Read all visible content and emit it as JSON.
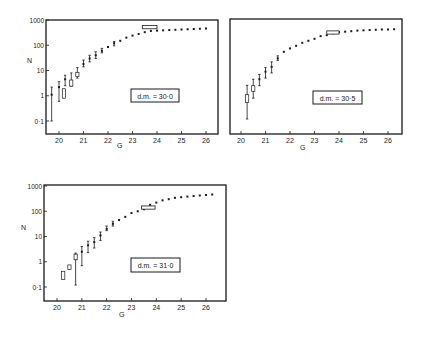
{
  "figure": {
    "panels_count": 3,
    "colors": {
      "ink": "#1a1a1a",
      "background": "#ffffff"
    }
  },
  "chart_data": [
    {
      "type": "scatter",
      "title": "",
      "label": "d.m. = 30·0",
      "xlabel": "G",
      "ylabel": "N",
      "yscale": "log",
      "xlim": [
        19.5,
        26.5
      ],
      "ylim": [
        0.03,
        1000
      ],
      "xticks": [
        "20",
        "21",
        "22",
        "23",
        "24",
        "25",
        "26"
      ],
      "yticks": [
        "0·1",
        "1",
        "10",
        "100",
        "1000"
      ],
      "grid": false,
      "frame": {
        "x0": 46,
        "y0": 20,
        "x1": 218,
        "y1": 134,
        "gx0": 59,
        "gx1": 206,
        "ytop": 20,
        "ybot": 121
      },
      "points": [
        {
          "g": 19.7,
          "n": 1.1,
          "lo": 0.1,
          "hi": 2.2
        },
        {
          "g": 20.0,
          "n": 2.2,
          "lo": 0.6,
          "hi": 3.6
        },
        {
          "g": 20.2,
          "n": 1.3,
          "box": [
            0.8,
            1.9
          ]
        },
        {
          "g": 20.25,
          "n": 4.5,
          "lo": 2.5,
          "hi": 6.5
        },
        {
          "g": 20.5,
          "n": 3.2,
          "box": [
            2.4,
            4.2
          ],
          "lo": 2.4,
          "hi": 8
        },
        {
          "g": 20.75,
          "n": 7,
          "box": [
            5.8,
            8.5
          ],
          "lo": 5,
          "hi": 13
        },
        {
          "g": 21.0,
          "n": 18,
          "lo": 14,
          "hi": 26
        },
        {
          "g": 21.25,
          "n": 30,
          "lo": 22,
          "hi": 40
        },
        {
          "g": 21.5,
          "n": 40,
          "lo": 30,
          "hi": 55
        },
        {
          "g": 21.75,
          "n": 60,
          "lo": 50,
          "hi": 75
        },
        {
          "g": 22.0,
          "n": 85
        },
        {
          "g": 22.25,
          "n": 120,
          "lo": 95,
          "hi": 140
        },
        {
          "g": 22.5,
          "n": 150
        },
        {
          "g": 22.75,
          "n": 200
        },
        {
          "g": 23.0,
          "n": 240
        },
        {
          "g": 23.25,
          "n": 280
        },
        {
          "g": 23.5,
          "n": 330
        },
        {
          "g": 23.75,
          "n": 370
        },
        {
          "g": 24.0,
          "n": 380
        },
        {
          "g": 24.25,
          "n": 390
        },
        {
          "g": 24.5,
          "n": 400
        },
        {
          "g": 24.75,
          "n": 410
        },
        {
          "g": 25.0,
          "n": 420
        },
        {
          "g": 25.25,
          "n": 430
        },
        {
          "g": 25.5,
          "n": 440
        },
        {
          "g": 25.75,
          "n": 450
        },
        {
          "g": 26.0,
          "n": 460
        }
      ],
      "hbar": {
        "g0": 23.4,
        "g1": 24.0,
        "n": 520
      }
    },
    {
      "type": "scatter",
      "title": "",
      "label": "d.m. = 30·5",
      "xlabel": "G",
      "ylabel": "",
      "yscale": "log",
      "xlim": [
        19.5,
        26.5
      ],
      "ylim": [
        0.03,
        1000
      ],
      "xticks": [
        "20",
        "21",
        "22",
        "23",
        "24",
        "25",
        "26"
      ],
      "yticks": [],
      "grid": false,
      "frame": {
        "x0": 230,
        "y0": 19,
        "x1": 402,
        "y1": 134,
        "gx0": 241,
        "gx1": 388,
        "ytop": 20,
        "ybot": 121
      },
      "points": [
        {
          "g": 20.25,
          "n": 0.8,
          "box": [
            0.55,
            1.1
          ],
          "lo": 0.12,
          "hi": 2.6
        },
        {
          "g": 20.5,
          "n": 1.8,
          "box": [
            1.5,
            2.5
          ],
          "lo": 0.8,
          "hi": 4.5
        },
        {
          "g": 20.75,
          "n": 4.5,
          "lo": 2.5,
          "hi": 7
        },
        {
          "g": 21.0,
          "n": 9,
          "lo": 5,
          "hi": 13
        },
        {
          "g": 21.25,
          "n": 14,
          "lo": 8,
          "hi": 22
        },
        {
          "g": 21.5,
          "n": 30,
          "lo": 25,
          "hi": 38
        },
        {
          "g": 21.75,
          "n": 55
        },
        {
          "g": 22.0,
          "n": 75
        },
        {
          "g": 22.25,
          "n": 95
        },
        {
          "g": 22.5,
          "n": 125
        },
        {
          "g": 22.75,
          "n": 150
        },
        {
          "g": 23.0,
          "n": 180
        },
        {
          "g": 23.25,
          "n": 230
        },
        {
          "g": 23.5,
          "n": 250
        },
        {
          "g": 23.75,
          "n": 300
        },
        {
          "g": 24.0,
          "n": 330
        },
        {
          "g": 24.25,
          "n": 345
        },
        {
          "g": 24.5,
          "n": 360
        },
        {
          "g": 24.75,
          "n": 380
        },
        {
          "g": 25.0,
          "n": 390
        },
        {
          "g": 25.25,
          "n": 400
        },
        {
          "g": 25.5,
          "n": 410
        },
        {
          "g": 25.75,
          "n": 420
        },
        {
          "g": 26.0,
          "n": 420
        },
        {
          "g": 26.25,
          "n": 430
        }
      ],
      "hbar": {
        "g0": 23.5,
        "g1": 24.0,
        "n": 320
      }
    },
    {
      "type": "scatter",
      "title": "",
      "label": "d.m. = 31·0",
      "xlabel": "G",
      "ylabel": "N",
      "yscale": "log",
      "xlim": [
        19.5,
        26.5
      ],
      "ylim": [
        0.03,
        1000
      ],
      "xticks": [
        "20",
        "21",
        "22",
        "23",
        "24",
        "25",
        "26"
      ],
      "yticks": [
        "0·1",
        "1",
        "10",
        "100",
        "1000"
      ],
      "grid": false,
      "frame": {
        "x0": 44,
        "y0": 185,
        "x1": 226,
        "y1": 301,
        "gx0": 57,
        "gx1": 206,
        "ytop": 186,
        "ybot": 287
      },
      "points": [
        {
          "g": 20.25,
          "n": 0.3,
          "box": [
            0.2,
            0.42
          ]
        },
        {
          "g": 20.5,
          "n": 0.6,
          "box": [
            0.5,
            0.75
          ]
        },
        {
          "g": 20.75,
          "n": 1.6,
          "box": [
            1.2,
            2.0
          ],
          "lo": 0.12,
          "hi": 2.2
        },
        {
          "g": 21.0,
          "n": 2.5,
          "lo": 0.7,
          "hi": 4
        },
        {
          "g": 21.25,
          "n": 4.5,
          "lo": 2.3,
          "hi": 6.5
        },
        {
          "g": 21.5,
          "n": 6,
          "lo": 3.5,
          "hi": 9
        },
        {
          "g": 21.75,
          "n": 11,
          "lo": 7,
          "hi": 15
        },
        {
          "g": 22.0,
          "n": 20,
          "lo": 17,
          "hi": 26
        },
        {
          "g": 22.25,
          "n": 32,
          "lo": 26,
          "hi": 40
        },
        {
          "g": 22.5,
          "n": 45
        },
        {
          "g": 22.75,
          "n": 60
        },
        {
          "g": 23.0,
          "n": 85
        },
        {
          "g": 23.25,
          "n": 100
        },
        {
          "g": 23.5,
          "n": 120
        },
        {
          "g": 23.75,
          "n": 180
        },
        {
          "g": 24.0,
          "n": 220
        },
        {
          "g": 24.25,
          "n": 270
        },
        {
          "g": 24.5,
          "n": 300
        },
        {
          "g": 24.75,
          "n": 340
        },
        {
          "g": 25.0,
          "n": 360
        },
        {
          "g": 25.25,
          "n": 380
        },
        {
          "g": 25.5,
          "n": 400
        },
        {
          "g": 25.75,
          "n": 420
        },
        {
          "g": 26.0,
          "n": 440
        },
        {
          "g": 26.25,
          "n": 460
        }
      ],
      "hbar": {
        "g0": 23.4,
        "g1": 23.95,
        "n": 140
      }
    }
  ]
}
